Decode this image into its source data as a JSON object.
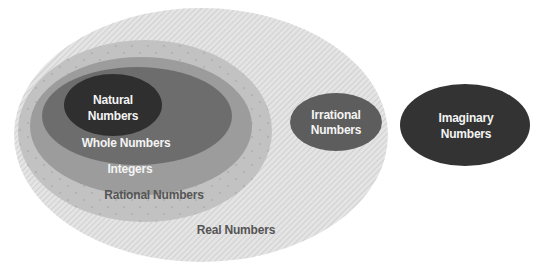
{
  "diagram": {
    "sets": {
      "real": {
        "label": "Real Numbers",
        "fill": "#e2e2e2",
        "hatch": "#c9c9c9",
        "ellipse": {
          "cx": 201,
          "cy": 135,
          "rx": 187,
          "ry": 127
        }
      },
      "rational": {
        "label": "Rational Numbers",
        "fill": "#c3c3c3",
        "ellipse": {
          "cx": 145,
          "cy": 131,
          "rx": 127,
          "ry": 91
        }
      },
      "integers": {
        "label": "Integers",
        "fill": "#9d9d9d",
        "ellipse": {
          "cx": 141,
          "cy": 126,
          "rx": 111,
          "ry": 69
        }
      },
      "whole": {
        "label": "Whole Numbers",
        "fill": "#6e6e6e",
        "ellipse": {
          "cx": 137,
          "cy": 116,
          "rx": 95,
          "ry": 49
        }
      },
      "natural": {
        "label_line1": "Natural",
        "label_line2": "Numbers",
        "fill": "#303030",
        "ellipse": {
          "cx": 113,
          "cy": 105,
          "rx": 49,
          "ry": 31
        }
      },
      "irrational": {
        "label_line1": "Irrational",
        "label_line2": "Numbers",
        "fill": "#5e5e5e",
        "ellipse": {
          "cx": 336,
          "cy": 122,
          "rx": 46,
          "ry": 29
        }
      },
      "imaginary": {
        "label_line1": "Imaginary",
        "label_line2": "Numbers",
        "fill": "#333333",
        "ellipse": {
          "cx": 465,
          "cy": 125,
          "rx": 65,
          "ry": 41
        }
      }
    }
  }
}
